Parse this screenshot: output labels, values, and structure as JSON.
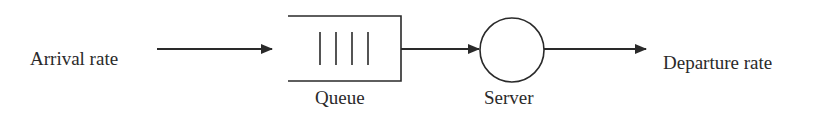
{
  "diagram": {
    "type": "single-server queueing system",
    "nodes": [
      {
        "id": "arrival",
        "label": "Arrival rate",
        "shape": "text"
      },
      {
        "id": "queue",
        "label": "Queue",
        "shape": "open-rectangle",
        "slots": 4
      },
      {
        "id": "server",
        "label": "Server",
        "shape": "circle"
      },
      {
        "id": "departure",
        "label": "Departure rate",
        "shape": "text"
      }
    ],
    "edges": [
      {
        "from": "arrival",
        "to": "queue"
      },
      {
        "from": "queue",
        "to": "server"
      },
      {
        "from": "server",
        "to": "departure"
      }
    ],
    "labels": {
      "arrival": "Arrival rate",
      "queue": "Queue",
      "server": "Server",
      "departure": "Departure rate"
    },
    "colors": {
      "stroke": "#2a2a2a",
      "background": "#ffffff"
    }
  }
}
